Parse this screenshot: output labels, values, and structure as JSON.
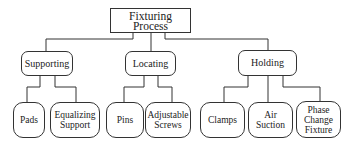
{
  "diagram": {
    "type": "hierarchy-tree",
    "root": {
      "label": "Fixturing Process"
    },
    "categories": [
      {
        "label": "Supporting",
        "children": [
          {
            "label": "Pads"
          },
          {
            "label": "Equalizing\nSupport"
          }
        ]
      },
      {
        "label": "Locating",
        "children": [
          {
            "label": "Pins"
          },
          {
            "label": "Adjustable\nScrews"
          }
        ]
      },
      {
        "label": "Holding",
        "children": [
          {
            "label": "Clamps"
          },
          {
            "label": "Air\nSuction"
          },
          {
            "label": "Phase\nChange\nFixture"
          }
        ]
      }
    ],
    "colors": {
      "line": "#333333",
      "background": "#ffffff",
      "text": "#222222"
    }
  }
}
